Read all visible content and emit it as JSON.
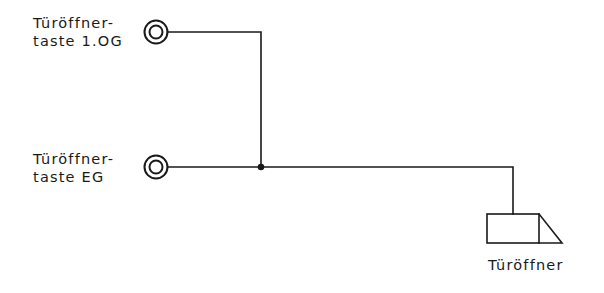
{
  "diagram": {
    "type": "wiring-schematic",
    "colors": {
      "line": "#1a1a1a",
      "background": "#ffffff"
    },
    "components": [
      {
        "id": "button-1og",
        "symbol": "push-button-icon",
        "label_line1": "Türöffner-",
        "label_line2": "taste 1.OG"
      },
      {
        "id": "button-eg",
        "symbol": "push-button-icon",
        "label_line1": "Türöffner-",
        "label_line2": "taste EG"
      },
      {
        "id": "door-opener",
        "symbol": "door-opener-icon",
        "label": "Türöffner"
      }
    ],
    "connections": [
      {
        "from": "button-1og",
        "to": "junction"
      },
      {
        "from": "button-eg",
        "to": "junction"
      },
      {
        "from": "junction",
        "to": "door-opener"
      }
    ]
  }
}
